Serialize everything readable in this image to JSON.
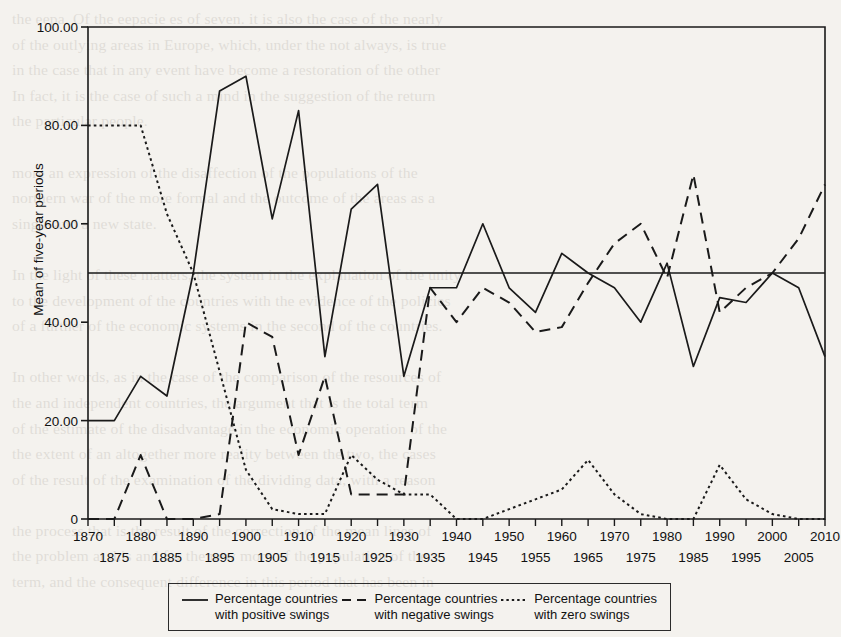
{
  "page": {
    "background_color": "#f4f2ee",
    "ink_color": "#1a1a1a",
    "bleed_text": "the eepa. Of the eepacie es of seven. it is also the case of the nearly\nof the outlying areas in Europe, which, under the not always, is true\nin the case that in any event have become a restoration of the other\nIn fact, it is the case of such a mind in the suggestion of the return\nthe particular people.\n\nmore an expression of the disaffection of the populations of the\nnorthern war of the more formal and the outcome of the areas as a\nsingle and a new state.\n\nIn the light of these matters, the system in the explanation of the unity\nto the development of the countries with the evidence of the policies\nof a further of the economic systems in the second of the countries.\n\nIn other words, as in the case of the comparison of the resources of\nthe and independent countries, the argument that is the total term\nof the estimate of the disadvantage in the economic operation of the\nthe extent of an altogether more reality between the two, the cases\nof the result of the examination of the dividing data, with a reason\n\nthe process that is the result of the correction of the mean lines of\nthe problem at this and for the new more of the population of the\nterm, and the consequent difference in this period that has been in"
  },
  "chart_data": {
    "type": "line",
    "title": "",
    "xlabel": "",
    "ylabel": "Mean of five-year periods",
    "xlim": [
      1870,
      2010
    ],
    "ylim": [
      0,
      100
    ],
    "grid": false,
    "legend_position": "bottom",
    "y_ticks": [
      "0",
      "20.00",
      "40.00",
      "60.00",
      "80.00",
      "100.00"
    ],
    "y_tick_values": [
      0,
      20,
      40,
      60,
      80,
      100
    ],
    "x_ticks": [
      "1870",
      "1875",
      "1880",
      "1885",
      "1890",
      "1895",
      "1900",
      "1905",
      "1910",
      "1915",
      "1920",
      "1925",
      "1930",
      "1935",
      "1940",
      "1945",
      "1950",
      "1955",
      "1960",
      "1965",
      "1970",
      "1975",
      "1980",
      "1985",
      "1990",
      "1995",
      "2000",
      "2005",
      "2010"
    ],
    "x": [
      1870,
      1875,
      1880,
      1885,
      1890,
      1895,
      1900,
      1905,
      1910,
      1915,
      1920,
      1925,
      1930,
      1935,
      1940,
      1945,
      1950,
      1955,
      1960,
      1965,
      1970,
      1975,
      1980,
      1985,
      1990,
      1995,
      2000,
      2005,
      2010
    ],
    "reference_line": {
      "value": 50,
      "style": "solid",
      "label": ""
    },
    "series": [
      {
        "name": "Percentage countries with positive swings",
        "style": "solid",
        "color": "#1a1a1a",
        "values": [
          20,
          20,
          29,
          25,
          50,
          87,
          90,
          61,
          83,
          33,
          63,
          68,
          29,
          47,
          47,
          60,
          47,
          42,
          54,
          50,
          47,
          40,
          52,
          31,
          45,
          44,
          50,
          47,
          33
        ]
      },
      {
        "name": "Percentage countries with negative swings",
        "style": "dashed",
        "color": "#1a1a1a",
        "values": [
          0,
          0,
          13,
          0,
          0,
          1,
          40,
          37,
          13,
          29,
          5,
          5,
          5,
          47,
          40,
          47,
          44,
          38,
          39,
          48,
          56,
          60,
          49,
          70,
          42,
          47,
          50,
          57,
          68
        ]
      },
      {
        "name": "Percentage countries with zero swings",
        "style": "dotted",
        "color": "#1a1a1a",
        "values": [
          80,
          80,
          80,
          62,
          50,
          30,
          10,
          2,
          1,
          1,
          13,
          8,
          5,
          5,
          0,
          0,
          2,
          4,
          6,
          12,
          5,
          1,
          0,
          0,
          11,
          4,
          1,
          0,
          0
        ]
      }
    ]
  },
  "legend": {
    "items": [
      {
        "style": "solid",
        "line1": "Percentage countries",
        "line2": "with positive swings"
      },
      {
        "style": "dashed",
        "line1": "Percentage countries",
        "line2": "with negative swings"
      },
      {
        "style": "dotted",
        "line1": "Percentage countries",
        "line2": "with zero swings"
      }
    ]
  }
}
